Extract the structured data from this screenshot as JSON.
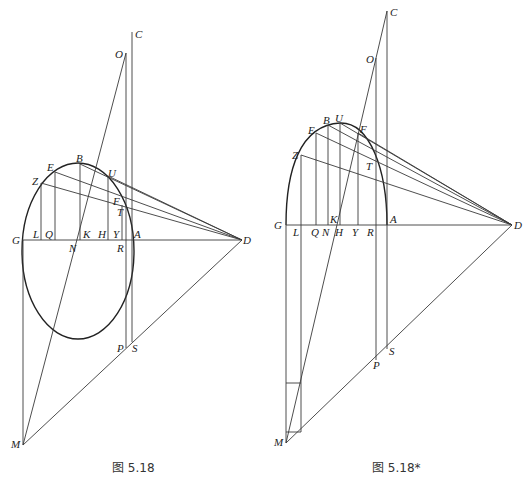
{
  "figures": [
    {
      "id": "fig-5-18",
      "caption": "图 5.18",
      "labels": {
        "C": "C",
        "O": "O",
        "B": "B",
        "E": "E",
        "U": "U",
        "Z": "Z",
        "F": "F",
        "T": "T",
        "G": "G",
        "L": "L",
        "Q": "Q",
        "K": "K",
        "H": "H",
        "Y": "Y",
        "A": "A",
        "N": "N",
        "R": "R",
        "D": "D",
        "P": "P",
        "S": "S",
        "M": "M"
      }
    },
    {
      "id": "fig-5-18-star",
      "caption": "图 5.18*",
      "labels": {
        "C": "C",
        "O": "O",
        "B": "B",
        "U": "U",
        "E": "E",
        "F": "F",
        "Z": "Z",
        "T": "T",
        "G": "G",
        "L": "L",
        "Q": "Q",
        "N": "N",
        "K": "K",
        "H": "H",
        "Y": "Y",
        "R": "R",
        "A": "A",
        "D": "D",
        "S": "S",
        "P": "P",
        "M": "M"
      }
    }
  ]
}
